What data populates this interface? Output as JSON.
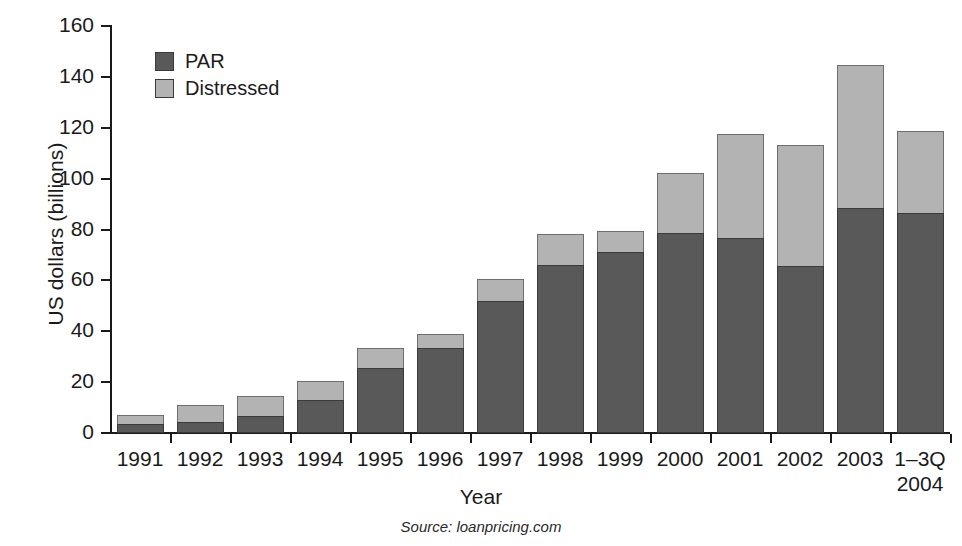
{
  "chart_data": {
    "type": "bar",
    "subtype": "stacked-vertical",
    "title": "",
    "xlabel": "Year",
    "ylabel": "US dollars (billions)",
    "ylim": [
      0,
      160
    ],
    "yticks": [
      0,
      20,
      40,
      60,
      80,
      100,
      120,
      140,
      160
    ],
    "ytick_labels": [
      "0",
      "20",
      "40",
      "60",
      "80",
      "100",
      "120",
      "140",
      "160"
    ],
    "grid": false,
    "legend_position": "upper-left-inside",
    "categories": [
      "1991",
      "1992",
      "1993",
      "1994",
      "1995",
      "1996",
      "1997",
      "1998",
      "1999",
      "2000",
      "2001",
      "2002",
      "2003",
      "1–3Q\n2004"
    ],
    "category_labels": [
      {
        "line1": "1991",
        "line2": ""
      },
      {
        "line1": "1992",
        "line2": ""
      },
      {
        "line1": "1993",
        "line2": ""
      },
      {
        "line1": "1994",
        "line2": ""
      },
      {
        "line1": "1995",
        "line2": ""
      },
      {
        "line1": "1996",
        "line2": ""
      },
      {
        "line1": "1997",
        "line2": ""
      },
      {
        "line1": "1998",
        "line2": ""
      },
      {
        "line1": "1999",
        "line2": ""
      },
      {
        "line1": "2000",
        "line2": ""
      },
      {
        "line1": "2001",
        "line2": ""
      },
      {
        "line1": "2002",
        "line2": ""
      },
      {
        "line1": "2003",
        "line2": ""
      },
      {
        "line1": "1–3Q",
        "line2": "2004"
      }
    ],
    "series": [
      {
        "name": "PAR",
        "color": "#595959",
        "values": [
          3.5,
          4.5,
          6.5,
          13.0,
          25.5,
          33.5,
          52.0,
          66.0,
          71.0,
          78.5,
          76.5,
          65.5,
          88.5,
          86.5
        ]
      },
      {
        "name": "Distressed",
        "color": "#b3b3b3",
        "values": [
          4.0,
          7.0,
          8.5,
          8.0,
          8.5,
          6.0,
          9.0,
          12.5,
          9.0,
          24.0,
          41.5,
          48.0,
          56.5,
          32.5
        ]
      }
    ],
    "totals": [
      7.5,
      11.5,
      15.0,
      21.0,
      34.0,
      39.5,
      61.0,
      78.5,
      80.0,
      102.5,
      118.0,
      113.5,
      145.0,
      119.0
    ],
    "annotations": []
  },
  "legend": {
    "items": [
      {
        "label": "PAR",
        "color": "#595959"
      },
      {
        "label": "Distressed",
        "color": "#b3b3b3"
      }
    ]
  },
  "source": {
    "label": "Source:",
    "value": "loanpricing.com"
  }
}
